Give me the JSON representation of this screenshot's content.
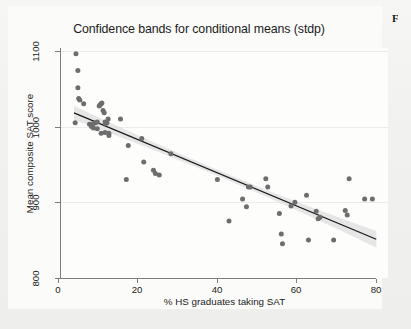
{
  "figure": {
    "corner_letter": "F",
    "background_color": "#f1f1ef",
    "panel_color": "#fbfbfa"
  },
  "chart_data": {
    "type": "scatter",
    "title": "Confidence bands for conditional means (stdp)",
    "xlabel": "% HS graduates taking SAT",
    "ylabel": "Mean composite SAT score",
    "xlim": [
      0,
      84
    ],
    "ylim": [
      800,
      1110
    ],
    "xticks": [
      0,
      20,
      40,
      60,
      80
    ],
    "xtick_labels": [
      "0",
      "20",
      "40",
      "60",
      "80"
    ],
    "yticks": [
      800,
      900,
      1000,
      1100
    ],
    "ytick_labels": [
      "800",
      "900",
      "1000",
      "1100"
    ],
    "grid": true,
    "grid_axis": "y",
    "legend": "none",
    "marker_color": "#6d6d6d",
    "line_color": "#1a1a1a",
    "band_color": "#e2e2e2",
    "x": [
      4.5,
      5.0,
      5.0,
      5.2,
      4.3,
      5.5,
      6.5,
      8.0,
      8.5,
      9.0,
      9.5,
      10.0,
      10.5,
      10.8,
      11.0,
      11.2,
      11.5,
      11.8,
      12.0,
      12.2,
      12.5,
      13.0,
      9.0,
      10.0,
      11.0,
      12.0,
      13.0,
      12.8,
      16.0,
      17.5,
      18.0,
      21.5,
      22.0,
      24.5,
      25.0,
      26.0,
      29.0,
      41.0,
      44.0,
      47.5,
      48.5,
      49.0,
      49.5,
      53.5,
      54.0,
      57.0,
      57.5,
      57.8,
      60.0,
      61.0,
      64.0,
      64.5,
      66.5,
      67.0,
      67.5,
      71.0,
      74.0,
      74.5,
      75.0,
      79.0,
      81.0
    ],
    "y": [
      1089,
      1067,
      1044,
      1030,
      998,
      1028,
      1023,
      996,
      993,
      997,
      998,
      999,
      1020,
      1022,
      1023,
      1024,
      1014,
      1011,
      999,
      997,
      998,
      984,
      991,
      990,
      984,
      985,
      981,
      1003,
      1003,
      923,
      968,
      977,
      946,
      935,
      931,
      929,
      957,
      923,
      868,
      897,
      887,
      913,
      913,
      924,
      913,
      878,
      851,
      838,
      888,
      893,
      902,
      843,
      881,
      871,
      873,
      843,
      882,
      876,
      924,
      897,
      897
    ],
    "fit_line": {
      "description": "Linear regression of mean composite SAT score on % HS graduates taking SAT",
      "x_start": 4.0,
      "y_start": 1011,
      "x_end": 82.0,
      "y_end": 844
    },
    "confidence_band": {
      "description": "Confidence band for conditional means (stdp)",
      "level": "95%",
      "half_width_at_left": 9,
      "half_width_at_right": 11
    }
  }
}
